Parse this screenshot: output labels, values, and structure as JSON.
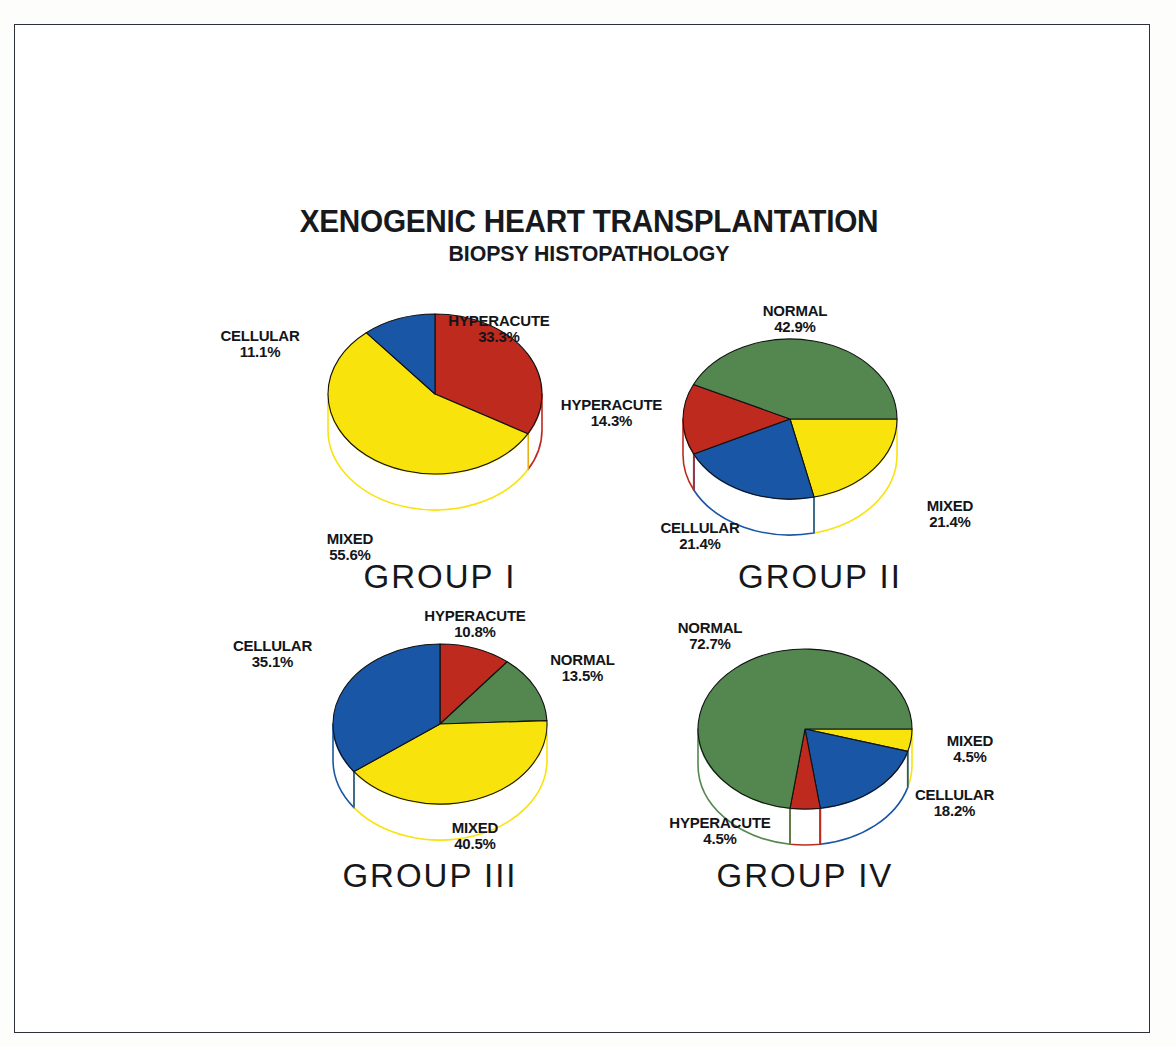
{
  "figure": {
    "title": "XENOGENIC HEART TRANSPLANTATION",
    "subtitle": "BIOPSY HISTOPATHOLOGY",
    "background": "#ffffff",
    "frame_color": "#2c3038"
  },
  "palette": {
    "hyperacute": "#bf2a1e",
    "cellular": "#1a56a6",
    "mixed": "#f9e30d",
    "normal": "#53874f",
    "wall_fill": "#ffffff",
    "outline": "#111111"
  },
  "chart_data": [
    {
      "type": "pie",
      "title": "GROUP I",
      "unit": "%",
      "start_angle": 0,
      "categories": [
        "HYPERACUTE",
        "MIXED",
        "CELLULAR"
      ],
      "values": [
        33.3,
        55.6,
        11.1
      ],
      "colors": [
        "#bf2a1e",
        "#f9e30d",
        "#1a56a6"
      ],
      "labels": [
        {
          "name": "HYPERACUTE",
          "pct": "33.3%"
        },
        {
          "name": "MIXED",
          "pct": "55.6%"
        },
        {
          "name": "CELLULAR",
          "pct": "11.1%"
        }
      ]
    },
    {
      "type": "pie",
      "title": "GROUP II",
      "unit": "%",
      "start_angle": 90,
      "categories": [
        "MIXED",
        "CELLULAR",
        "HYPERACUTE",
        "NORMAL"
      ],
      "values": [
        21.4,
        21.4,
        14.3,
        42.9
      ],
      "colors": [
        "#f9e30d",
        "#1a56a6",
        "#bf2a1e",
        "#53874f"
      ],
      "labels": [
        {
          "name": "NORMAL",
          "pct": "42.9%"
        },
        {
          "name": "MIXED",
          "pct": "21.4%"
        },
        {
          "name": "CELLULAR",
          "pct": "21.4%"
        },
        {
          "name": "HYPERACUTE",
          "pct": "14.3%"
        }
      ]
    },
    {
      "type": "pie",
      "title": "GROUP III",
      "unit": "%",
      "start_angle": 0,
      "categories": [
        "HYPERACUTE",
        "NORMAL",
        "MIXED",
        "CELLULAR"
      ],
      "values": [
        10.8,
        13.5,
        40.5,
        35.1
      ],
      "colors": [
        "#bf2a1e",
        "#53874f",
        "#f9e30d",
        "#1a56a6"
      ],
      "labels": [
        {
          "name": "HYPERACUTE",
          "pct": "10.8%"
        },
        {
          "name": "NORMAL",
          "pct": "13.5%"
        },
        {
          "name": "MIXED",
          "pct": "40.5%"
        },
        {
          "name": "CELLULAR",
          "pct": "35.1%"
        }
      ]
    },
    {
      "type": "pie",
      "title": "GROUP IV",
      "unit": "%",
      "start_angle": 90,
      "categories": [
        "MIXED",
        "CELLULAR",
        "HYPERACUTE",
        "NORMAL"
      ],
      "values": [
        4.5,
        18.2,
        4.5,
        72.7
      ],
      "colors": [
        "#f9e30d",
        "#1a56a6",
        "#bf2a1e",
        "#53874f"
      ],
      "labels": [
        {
          "name": "NORMAL",
          "pct": "72.7%"
        },
        {
          "name": "MIXED",
          "pct": "4.5%"
        },
        {
          "name": "CELLULAR",
          "pct": "18.2%"
        },
        {
          "name": "HYPERACUTE",
          "pct": "4.5%"
        }
      ]
    }
  ]
}
